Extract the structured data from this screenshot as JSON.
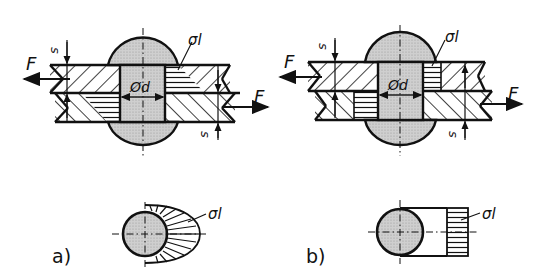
{
  "figure": {
    "panels": [
      {
        "id": "a",
        "caption": "a)",
        "labels": {
          "force_left": "F",
          "force_right": "F",
          "thickness_top": "s",
          "thickness_bottom": "s",
          "diameter": "Ød",
          "stress": "σl",
          "stress_plan": "σl"
        },
        "stress_distribution": "radial (cosine) bearing pressure on half circumference"
      },
      {
        "id": "b",
        "caption": "b)",
        "labels": {
          "force_left": "F",
          "force_right": "F",
          "thickness_top": "s",
          "thickness_bottom": "s",
          "diameter": "Ød",
          "stress": "σl",
          "stress_plan": "σl"
        },
        "stress_distribution": "uniform bearing pressure over projected area d·s"
      }
    ],
    "colors": {
      "line": "#111111",
      "rivet_fill": "#c8c8c8",
      "paper": "#ffffff"
    }
  }
}
